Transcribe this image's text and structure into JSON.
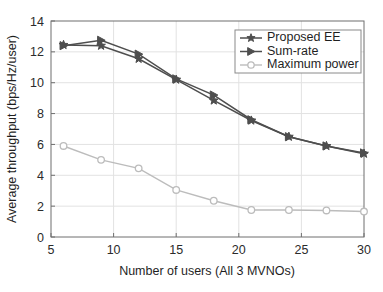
{
  "chart_data": {
    "type": "line",
    "title": "",
    "xlabel": "Number of users (All 3 MVNOs)",
    "ylabel": "Average throughput (bps/Hz/user)",
    "x": [
      6,
      9,
      12,
      15,
      18,
      21,
      24,
      27,
      30
    ],
    "xlim": [
      5,
      30
    ],
    "ylim": [
      0,
      14
    ],
    "xticks": [
      5,
      10,
      15,
      20,
      25,
      30
    ],
    "yticks": [
      0,
      2,
      4,
      6,
      8,
      10,
      12,
      14
    ],
    "grid": true,
    "legend_position": "upper right",
    "series": [
      {
        "name": "Proposed EE",
        "marker": "star",
        "color": "#4e4e4e",
        "values": [
          12.45,
          12.4,
          11.55,
          10.2,
          8.85,
          7.55,
          6.5,
          5.9,
          5.4
        ]
      },
      {
        "name": "Sum-rate",
        "marker": "triangle-right",
        "color": "#4e4e4e",
        "values": [
          12.4,
          12.75,
          11.85,
          10.25,
          9.2,
          7.6,
          6.5,
          5.9,
          5.45
        ]
      },
      {
        "name": "Maximum power",
        "marker": "circle-open",
        "color": "#bcbcbc",
        "values": [
          5.9,
          5.0,
          4.45,
          3.05,
          2.35,
          1.75,
          1.75,
          1.72,
          1.65
        ]
      }
    ]
  },
  "axes": {
    "x_tick_labels": [
      "5",
      "10",
      "15",
      "20",
      "25",
      "30"
    ],
    "y_tick_labels": [
      "0",
      "2",
      "4",
      "6",
      "8",
      "10",
      "12",
      "14"
    ],
    "x_axis_title": "Number of users (All 3 MVNOs)",
    "y_axis_title": "Average throughput (bps/Hz/user)"
  },
  "legend": {
    "entries": [
      {
        "label": "Proposed EE",
        "marker": "star-marker-icon"
      },
      {
        "label": "Sum-rate",
        "marker": "triangle-right-marker-icon"
      },
      {
        "label": "Maximum power",
        "marker": "circle-marker-icon"
      }
    ]
  },
  "colors": {
    "dark_series": "#4e4e4e",
    "light_series": "#bcbcbc",
    "axis": "#6f6f6f",
    "grid": "#e2e2e2",
    "background": "#ffffff"
  }
}
